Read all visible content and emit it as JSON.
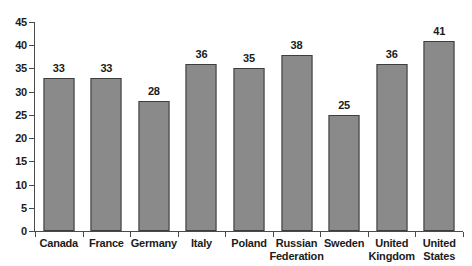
{
  "chart_data": {
    "type": "bar",
    "title": "",
    "subtitle": "",
    "xlabel": "",
    "ylabel": "",
    "ylim": [
      0,
      45
    ],
    "ytick_step": 5,
    "yticks": [
      "45",
      "40",
      "35",
      "30",
      "25",
      "20",
      "15",
      "10",
      "5",
      "0"
    ],
    "grid": false,
    "legend": false,
    "legend_position": "none",
    "categories": [
      "Canada",
      "France",
      "Germany",
      "Italy",
      "Poland",
      "Russian Federation",
      "Sweden",
      "United Kingdom",
      "United States"
    ],
    "category_lines": [
      [
        "Canada"
      ],
      [
        "France"
      ],
      [
        "Germany"
      ],
      [
        "Italy"
      ],
      [
        "Poland"
      ],
      [
        "Russian",
        "Federation"
      ],
      [
        "Sweden"
      ],
      [
        "United",
        "Kingdom"
      ],
      [
        "United",
        "States"
      ]
    ],
    "values": [
      33,
      33,
      28,
      36,
      35,
      38,
      25,
      36,
      41
    ],
    "value_labels": [
      "33",
      "33",
      "28",
      "36",
      "35",
      "38",
      "25",
      "36",
      "41"
    ],
    "bar_color": "#8a8a8a",
    "bar_border_color": "#3d3d3d",
    "axis_color": "#4a4a4a",
    "text_color": "#1b1b1b",
    "background_color": "#ffffff"
  }
}
